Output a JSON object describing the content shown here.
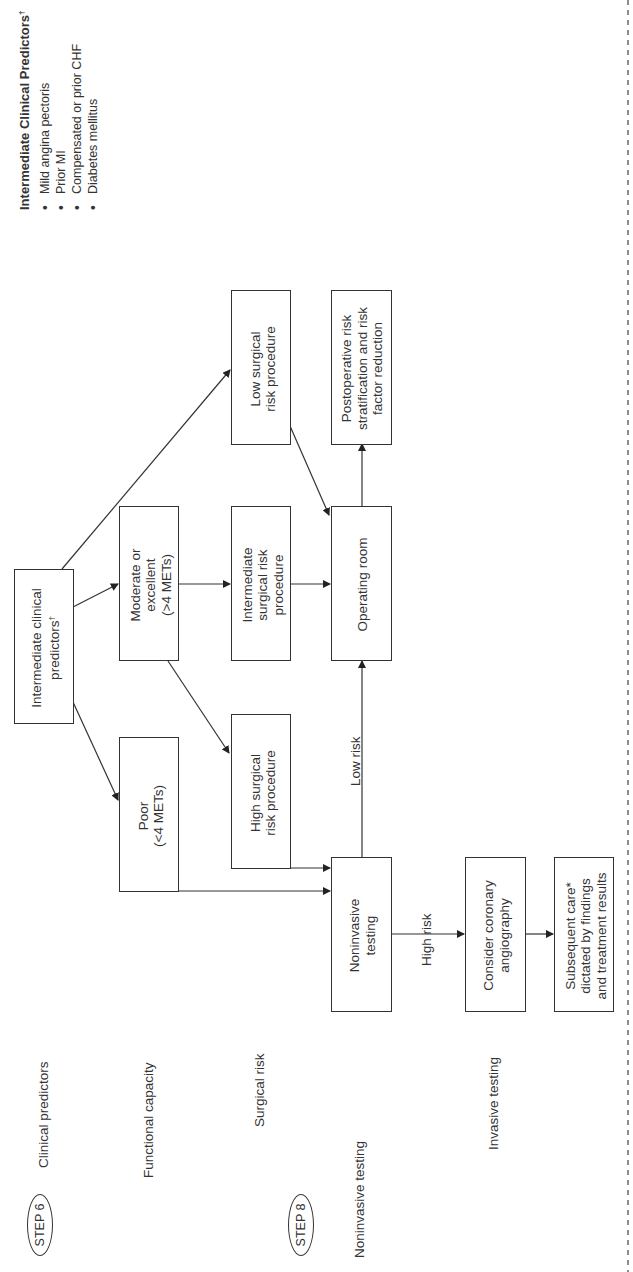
{
  "legend": {
    "title": "Intermediate Clinical Predictors",
    "title_mark": "†",
    "items": [
      "Mild angina pectoris",
      "Prior MI",
      "Compensated or prior CHF",
      "Diabetes mellitus"
    ]
  },
  "steps": [
    {
      "label": "STEP 6"
    },
    {
      "label": "STEP 8"
    }
  ],
  "row_labels": {
    "clinical_predictors": "Clinical predictors",
    "functional_capacity": "Functional capacity",
    "surgical_risk": "Surgical risk",
    "noninvasive_testing": "Noninvasive testing",
    "invasive_testing": "Invasive testing"
  },
  "nodes": {
    "intermediate_predictors": {
      "line1": "Intermediate clinical",
      "line2": "predictors",
      "mark": "†"
    },
    "poor": {
      "line1": "Poor",
      "line2": "(<4 METs)"
    },
    "moderate": {
      "line1": "Moderate or",
      "line2": "excellent",
      "line3": "(>4 METs)"
    },
    "high_surgical": {
      "line1": "High surgical",
      "line2": "risk procedure"
    },
    "intermediate_surgical": {
      "line1": "Intermediate",
      "line2": "surgical risk",
      "line3": "procedure"
    },
    "low_surgical": {
      "line1": "Low surgical",
      "line2": "risk procedure"
    },
    "operating_room": {
      "line1": "Operating room"
    },
    "postoperative": {
      "line1": "Postoperative risk",
      "line2": "stratification and risk",
      "line3": "factor reduction"
    },
    "noninvasive": {
      "line1": "Noninvasive",
      "line2": "testing"
    },
    "angiography": {
      "line1": "Consider coronary",
      "line2": "angiography"
    },
    "subsequent_care": {
      "line1": "Subsequent care*",
      "line2": "dictated by findings",
      "line3": "and treatment results"
    }
  },
  "edge_labels": {
    "low_risk": "Low risk",
    "high_risk": "High risk"
  },
  "colors": {
    "line": "#333333",
    "background": "#ffffff"
  }
}
